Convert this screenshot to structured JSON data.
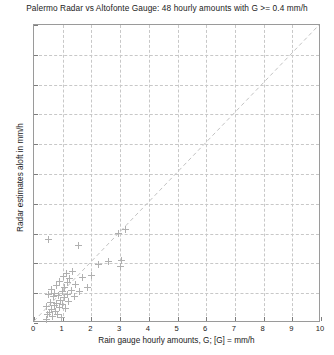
{
  "chart_data": {
    "type": "scatter",
    "title": "Palermo Radar vs Altofonte Gauge: 48 hourly amounts with G >= 0.4 mm/h",
    "xlabel": "Rain gauge hourly amounts, G; [G] = mm/h",
    "ylabel": "Radar estimates aloft in mm/h",
    "xlim": [
      0,
      10
    ],
    "ylim": [
      0,
      10
    ],
    "xticks": [
      "0",
      "1",
      "2",
      "3",
      "4",
      "5",
      "6",
      "7",
      "8",
      "9",
      "10"
    ],
    "yticks": [
      "0",
      "1",
      "2",
      "3",
      "4",
      "5",
      "6",
      "7",
      "8",
      "9",
      "10"
    ],
    "grid": true,
    "legend": "none",
    "marker": "plus",
    "marker_color": "#b0b0b0",
    "reference_line": {
      "label": "one-to-one line",
      "style": "dashed",
      "color": "#c0c0c0",
      "from": [
        0,
        0
      ],
      "to": [
        10,
        10
      ]
    },
    "n_points": 48,
    "points": [
      [
        0.42,
        0.12
      ],
      [
        0.45,
        0.55
      ],
      [
        0.48,
        0.28
      ],
      [
        0.5,
        2.8
      ],
      [
        0.52,
        0.95
      ],
      [
        0.55,
        0.35
      ],
      [
        0.58,
        0.7
      ],
      [
        0.6,
        1.12
      ],
      [
        0.62,
        0.45
      ],
      [
        0.65,
        0.22
      ],
      [
        0.68,
        0.88
      ],
      [
        0.7,
        0.58
      ],
      [
        0.72,
        1.0
      ],
      [
        0.75,
        0.4
      ],
      [
        0.78,
        0.65
      ],
      [
        0.8,
        1.25
      ],
      [
        0.82,
        0.3
      ],
      [
        0.85,
        0.92
      ],
      [
        0.88,
        0.52
      ],
      [
        0.9,
        1.4
      ],
      [
        0.92,
        0.75
      ],
      [
        0.95,
        0.18
      ],
      [
        0.98,
        1.05
      ],
      [
        1.0,
        0.62
      ],
      [
        1.02,
        1.55
      ],
      [
        1.05,
        0.85
      ],
      [
        1.08,
        1.2
      ],
      [
        1.1,
        0.48
      ],
      [
        1.12,
        1.65
      ],
      [
        1.15,
        0.95
      ],
      [
        1.18,
        1.35
      ],
      [
        1.2,
        0.72
      ],
      [
        1.25,
        1.48
      ],
      [
        1.3,
        1.1
      ],
      [
        1.35,
        1.72
      ],
      [
        1.4,
        0.9
      ],
      [
        1.45,
        1.28
      ],
      [
        1.55,
        2.6
      ],
      [
        1.6,
        1.05
      ],
      [
        1.7,
        1.52
      ],
      [
        1.85,
        1.18
      ],
      [
        2.0,
        1.6
      ],
      [
        2.25,
        1.95
      ],
      [
        2.6,
        2.05
      ],
      [
        2.95,
        3.0
      ],
      [
        3.0,
        1.88
      ],
      [
        3.05,
        2.1
      ],
      [
        3.2,
        3.15
      ]
    ]
  }
}
